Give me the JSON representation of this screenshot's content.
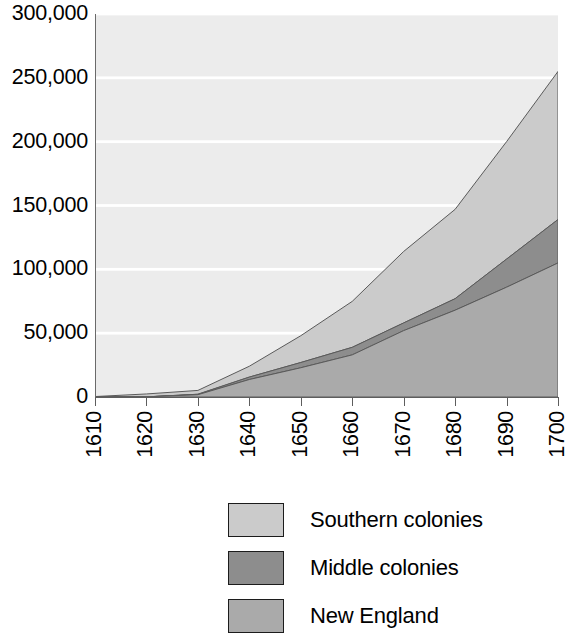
{
  "chart_data": {
    "type": "area",
    "stacked": true,
    "title": "",
    "subtitle": "",
    "xlabel": "",
    "ylabel": "",
    "x": [
      1610,
      1620,
      1630,
      1640,
      1650,
      1660,
      1670,
      1680,
      1690,
      1700
    ],
    "xtick_labels": [
      "1610",
      "1620",
      "1630",
      "1640",
      "1650",
      "1660",
      "1670",
      "1680",
      "1690",
      "1700"
    ],
    "ytick_labels": [
      "0",
      "50,000",
      "100,000",
      "150,000",
      "200,000",
      "250,000",
      "300,000"
    ],
    "ytick_values": [
      0,
      50000,
      100000,
      150000,
      200000,
      250000,
      300000
    ],
    "ylim": [
      0,
      300000
    ],
    "xlim": [
      1610,
      1700
    ],
    "grid": "horizontal",
    "gridline_color": "#ffffff",
    "plot_background": "#ececec",
    "legend_position": "below-center",
    "stack_order_bottom_to_top": [
      "New England",
      "Middle colonies",
      "Southern colonies"
    ],
    "series": [
      {
        "name": "New England",
        "color": "#aaaaaa",
        "values": [
          0,
          100,
          1800,
          13700,
          22900,
          33000,
          52000,
          68000,
          86000,
          105000
        ]
      },
      {
        "name": "Middle colonies",
        "color": "#8d8d8d",
        "values": [
          0,
          0,
          350,
          1900,
          4100,
          5900,
          6000,
          9000,
          22000,
          34000
        ]
      },
      {
        "name": "Southern colonies",
        "color": "#cbcbcb",
        "values": [
          350,
          2300,
          3000,
          8500,
          21000,
          36000,
          56000,
          70000,
          92000,
          116000
        ]
      }
    ],
    "stacked_totals": [
      350,
      2400,
      5150,
      24100,
      48000,
      74900,
      114000,
      147000,
      200000,
      255000
    ]
  },
  "yaxis": {
    "ticks": [
      {
        "label": "300,000",
        "value": 300000
      },
      {
        "label": "250,000",
        "value": 250000
      },
      {
        "label": "200,000",
        "value": 200000
      },
      {
        "label": "150,000",
        "value": 150000
      },
      {
        "label": "100,000",
        "value": 100000
      },
      {
        "label": "50,000",
        "value": 50000
      },
      {
        "label": "0",
        "value": 0
      }
    ]
  },
  "xaxis": {
    "ticks": [
      {
        "label": "1610"
      },
      {
        "label": "1620"
      },
      {
        "label": "1630"
      },
      {
        "label": "1640"
      },
      {
        "label": "1650"
      },
      {
        "label": "1660"
      },
      {
        "label": "1670"
      },
      {
        "label": "1680"
      },
      {
        "label": "1690"
      },
      {
        "label": "1700"
      }
    ]
  },
  "legend": {
    "items": [
      {
        "label": "Southern colonies",
        "color": "#cbcbcb"
      },
      {
        "label": "Middle colonies",
        "color": "#8d8d8d"
      },
      {
        "label": "New England",
        "color": "#aaaaaa"
      }
    ]
  }
}
